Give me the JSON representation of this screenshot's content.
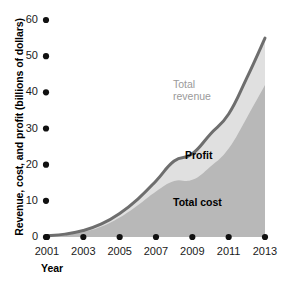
{
  "chart_data": {
    "type": "area",
    "title": "",
    "xlabel": "Year",
    "ylabel": "Revenue, cost, and profit (billions of dollars)",
    "x": [
      2001,
      2002,
      2003,
      2004,
      2005,
      2006,
      2007,
      2008,
      2009,
      2010,
      2011,
      2012,
      2013
    ],
    "xtick_labels": [
      "2001",
      "2003",
      "2005",
      "2007",
      "2009",
      "2011",
      "2013"
    ],
    "xticks": [
      2001,
      2003,
      2005,
      2007,
      2009,
      2011,
      2013
    ],
    "ytick_labels": [
      "0",
      "10",
      "20",
      "30",
      "40",
      "50",
      "60"
    ],
    "yticks": [
      0,
      10,
      20,
      30,
      40,
      50,
      60
    ],
    "ylim": [
      0,
      60
    ],
    "xlim": [
      2001,
      2013
    ],
    "grid": false,
    "legend_position": "inline-annotations",
    "series": [
      {
        "name": "Total revenue",
        "label": "Total revenue",
        "color": "#e0e0e0",
        "line_color": "#6e6e6e",
        "values": [
          0.3,
          0.8,
          1.8,
          3.6,
          6.5,
          10.5,
          15.5,
          21.0,
          23.0,
          28.5,
          34.0,
          44.0,
          55.0
        ]
      },
      {
        "name": "Total cost",
        "label": "Total cost",
        "color": "#b8b8b8",
        "values": [
          0.2,
          0.6,
          1.4,
          2.9,
          5.4,
          8.8,
          12.6,
          15.5,
          15.8,
          19.5,
          24.5,
          33.0,
          42.0
        ]
      },
      {
        "name": "Profit",
        "label": "Profit",
        "color": "#e0e0e0",
        "values": [
          0.1,
          0.2,
          0.4,
          0.7,
          1.1,
          1.7,
          2.9,
          5.5,
          7.2,
          9.0,
          9.5,
          11.0,
          13.0
        ]
      }
    ],
    "annotations": [
      {
        "text": "Total revenue",
        "series": "Total revenue"
      },
      {
        "text": "Profit",
        "series": "Profit"
      },
      {
        "text": "Total cost",
        "series": "Total cost"
      }
    ],
    "colors": {
      "revenue_fill": "#e0e0e0",
      "cost_fill": "#b8b8b8",
      "revenue_line": "#6e6e6e",
      "tick_dot": "#111111",
      "text": "#1a1a1a",
      "background": "#ffffff"
    }
  }
}
